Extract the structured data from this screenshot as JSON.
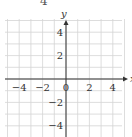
{
  "problem_number": "4",
  "chart_data": {
    "type": "scatter",
    "title": "",
    "xlabel": "x",
    "ylabel": "y",
    "xlim": [
      -5,
      5
    ],
    "ylim": [
      -5,
      5
    ],
    "grid": true,
    "grid_step": 1,
    "x_ticks": [
      -4,
      -2,
      0,
      2,
      4
    ],
    "y_ticks": [
      4,
      2,
      -2,
      -4
    ],
    "x_tick_labels": [
      "−4",
      "−2",
      "0",
      "2",
      "4"
    ],
    "y_tick_labels": [
      "4",
      "2",
      "−2",
      "−4"
    ],
    "series": []
  }
}
